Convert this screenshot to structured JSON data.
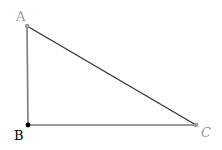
{
  "diagram": {
    "type": "right-triangle",
    "vertices": [
      {
        "id": "A",
        "label": "A",
        "x": 27,
        "y": 26,
        "color": "#9a9a9a",
        "label_x": 16,
        "label_y": 21
      },
      {
        "id": "B",
        "label": "B",
        "x": 28,
        "y": 125,
        "color": "#000000",
        "label_x": 14,
        "label_y": 140
      },
      {
        "id": "C",
        "label": "C",
        "x": 196,
        "y": 125,
        "color": "#9a9a9a",
        "label_x": 201,
        "label_y": 137
      }
    ],
    "edges": [
      {
        "from": "A",
        "to": "B",
        "color": "#7a7a7a"
      },
      {
        "from": "B",
        "to": "C",
        "color": "#7a7a7a"
      },
      {
        "from": "A",
        "to": "C",
        "color": "#333333"
      }
    ]
  }
}
